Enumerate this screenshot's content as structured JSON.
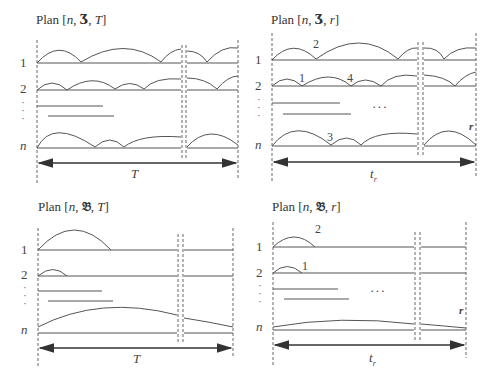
{
  "figure": {
    "panels": [
      {
        "id": "top-left",
        "title_prefix": "Plan [",
        "title_n": "n",
        "title_symbol": "Ʒ",
        "title_last": "T",
        "title_suffix": "]",
        "row_labels": [
          "1",
          "2",
          "n"
        ],
        "span_label": "T",
        "annotations": []
      },
      {
        "id": "top-right",
        "title_prefix": "Plan [",
        "title_n": "n",
        "title_symbol": "Ʒ",
        "title_last": "r",
        "title_suffix": "]",
        "row_labels": [
          "1",
          "2",
          "n"
        ],
        "span_label": "t",
        "span_label_sub": "r",
        "annotations": [
          "2",
          "1",
          "4",
          "3",
          "r"
        ],
        "ellipsis": "···"
      },
      {
        "id": "bottom-left",
        "title_prefix": "Plan [",
        "title_n": "n",
        "title_symbol": "𝔅",
        "title_last": "T",
        "title_suffix": "]",
        "row_labels": [
          "1",
          "2",
          "n"
        ],
        "span_label": "T",
        "annotations": []
      },
      {
        "id": "bottom-right",
        "title_prefix": "Plan [",
        "title_n": "n",
        "title_symbol": "𝔅",
        "title_last": "r",
        "title_suffix": "]",
        "row_labels": [
          "1",
          "2",
          "n"
        ],
        "span_label": "t",
        "span_label_sub": "r",
        "annotations": [
          "2",
          "1",
          "r"
        ],
        "ellipsis": "···"
      }
    ],
    "vdots": "·\n·\n·",
    "colors": {
      "line": "#555555",
      "text": "#333333",
      "background": "#ffffff"
    }
  }
}
